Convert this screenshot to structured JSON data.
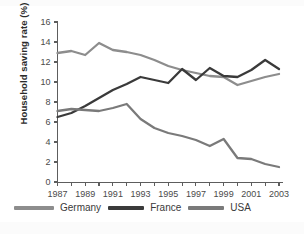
{
  "chart_data": {
    "type": "line",
    "title": "",
    "xlabel": "",
    "ylabel": "Household saving rate (%)",
    "ylim": [
      0,
      16
    ],
    "xlim": [
      1987,
      2003
    ],
    "yticks": [
      "0",
      "2",
      "4",
      "6",
      "8",
      "10",
      "12",
      "14",
      "16"
    ],
    "grid": false,
    "legend_position": "bottom",
    "x": [
      1987,
      1988,
      1989,
      1990,
      1991,
      1992,
      1993,
      1994,
      1995,
      1996,
      1997,
      1998,
      1999,
      2000,
      2001,
      2002,
      2003
    ],
    "xtick_labels": [
      "1987",
      "1989",
      "1991",
      "1993",
      "1995",
      "1997",
      "1999",
      "2001",
      "2003"
    ],
    "series": [
      {
        "name": "Germany",
        "color": "#8d8d8d",
        "values": [
          12.9,
          13.1,
          12.7,
          13.9,
          13.2,
          13.0,
          12.7,
          12.2,
          11.6,
          11.2,
          10.9,
          10.6,
          10.5,
          9.7,
          10.1,
          10.5,
          10.8
        ]
      },
      {
        "name": "France",
        "color": "#3a3a3a",
        "values": [
          6.5,
          6.9,
          7.6,
          8.4,
          9.2,
          9.8,
          10.5,
          10.2,
          9.9,
          11.3,
          10.2,
          11.4,
          10.6,
          10.5,
          11.2,
          12.2,
          11.3
        ]
      },
      {
        "name": "USA",
        "color": "#7a7a7a",
        "values": [
          7.1,
          7.3,
          7.2,
          7.1,
          7.4,
          7.8,
          6.3,
          5.4,
          4.9,
          4.6,
          4.2,
          3.6,
          4.3,
          2.4,
          2.3,
          1.8,
          1.5
        ]
      }
    ]
  },
  "legend": {
    "items": [
      {
        "label": "Germany"
      },
      {
        "label": "France"
      },
      {
        "label": "USA"
      }
    ]
  },
  "axes": {
    "y_axis_title": "Household saving rate (%)"
  }
}
